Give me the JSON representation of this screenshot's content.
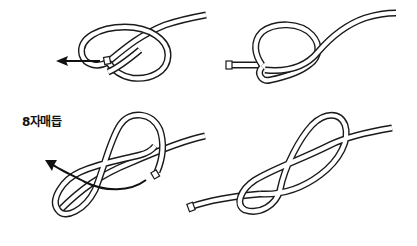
{
  "figure": {
    "title": "8자매듭",
    "panels": [
      {
        "id": "step-1",
        "description": "Loop formed with working end passed under standing part, arrow pointing left",
        "arrow_direction": "left"
      },
      {
        "id": "step-2",
        "description": "Working end tucked through loop, knot tightening"
      },
      {
        "id": "step-3",
        "description": "Figure-eight shape formed, curved arrow showing end passing through",
        "arrow_direction": "up-left"
      },
      {
        "id": "step-4",
        "description": "Completed figure-eight knot"
      }
    ]
  },
  "colors": {
    "line": "#1a1a1a",
    "background": "#ffffff"
  }
}
